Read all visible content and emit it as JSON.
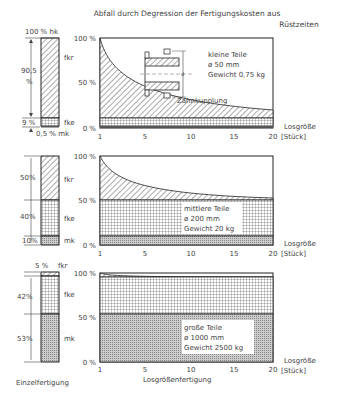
{
  "title_line1": "Abfall durch Degression der Fertigungskosten aus",
  "title_line2": "Rüstzeiten",
  "x_axis": {
    "ticks": [
      "1",
      "5",
      "10",
      "15",
      "20"
    ],
    "unit_line1": "Losgröße",
    "unit_line2": "[Stück]",
    "caption": "Losgrößenfertigung"
  },
  "left_caption": "Einzelfertigung",
  "y_ticks": [
    "100 %",
    "50 %",
    "0 %"
  ],
  "panels": [
    {
      "bar_top_label": "100 % hk",
      "segments": [
        {
          "code": "fkr",
          "pct_label": "90,5 %"
        },
        {
          "code": "fke",
          "pct_label": "9 %"
        },
        {
          "code": "mk",
          "pct_label": "0,5 % mk"
        }
      ],
      "note_line1": "kleine Teile",
      "note_line2": "ø 50 mm",
      "note_line3": "Gewicht 0,75 kg",
      "part_label": "Zahnkupplung",
      "part_dim": "d"
    },
    {
      "segments": [
        {
          "code": "fkr",
          "pct_label": "50%"
        },
        {
          "code": "fke",
          "pct_label": "40%"
        },
        {
          "code": "mk",
          "pct_label": "10%"
        }
      ],
      "note_line1": "mittlere Teile",
      "note_line2": "ø 200 mm",
      "note_line3": "Gewicht 20 kg"
    },
    {
      "segments": [
        {
          "code": "fkr",
          "pct_label": "5 %"
        },
        {
          "code": "fke",
          "pct_label": "42%"
        },
        {
          "code": "mk",
          "pct_label": "53%"
        }
      ],
      "note_line1": "große Teile",
      "note_line2": "ø 1000 mm",
      "note_line3": "Gewicht 2500 kg"
    }
  ]
}
